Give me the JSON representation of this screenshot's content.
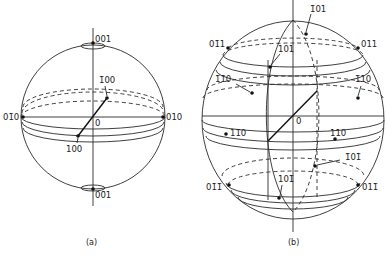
{
  "figure_a": {
    "caption": "(a)",
    "labels": {
      "top": "001",
      "bottom": "00̄1",
      "left": "01̄0",
      "right": "010",
      "back": "1̄00",
      "front": "100",
      "origin": "0"
    }
  },
  "figure_b": {
    "caption": "(b)",
    "labels": {
      "top_back": "1̄01",
      "top_front": "101",
      "upper_left": "01̄1",
      "upper_right": "011",
      "mid_back_left": "1̄1̄0",
      "mid_back_right": "1̄10",
      "mid_front_left": "11̄0",
      "mid_front_right": "110",
      "low_back": "1̄01̄",
      "low_front": "101̄",
      "lower_left": "01̄1̄",
      "lower_right": "011̄",
      "origin": "0"
    }
  }
}
